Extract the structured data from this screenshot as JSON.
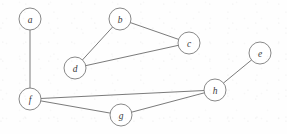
{
  "figure": {
    "width": 287,
    "height": 134,
    "background_color": "#fefefe",
    "node_fill_color": "#ffffff",
    "node_stroke_color": "#7a7a7a",
    "edge_stroke_color": "#6b6b6b",
    "label_color": "#3a3a3a",
    "node_radius": 11
  },
  "graph": {
    "type": "undirected-graph",
    "node_count": 8,
    "edge_count": 8,
    "nodes": [
      {
        "id": "a",
        "label": "a",
        "x": 30,
        "y": 19
      },
      {
        "id": "b",
        "label": "b",
        "x": 120,
        "y": 19
      },
      {
        "id": "c",
        "label": "c",
        "x": 189,
        "y": 43
      },
      {
        "id": "d",
        "label": "d",
        "x": 75,
        "y": 68
      },
      {
        "id": "e",
        "label": "e",
        "x": 260,
        "y": 53
      },
      {
        "id": "f",
        "label": "f",
        "x": 30,
        "y": 99
      },
      {
        "id": "g",
        "label": "g",
        "x": 121,
        "y": 115
      },
      {
        "id": "h",
        "label": "h",
        "x": 215,
        "y": 90
      }
    ],
    "edges": [
      {
        "id": "a-f",
        "source": "a",
        "target": "f"
      },
      {
        "id": "b-c",
        "source": "b",
        "target": "c"
      },
      {
        "id": "b-d",
        "source": "b",
        "target": "d"
      },
      {
        "id": "c-d",
        "source": "c",
        "target": "d"
      },
      {
        "id": "e-h",
        "source": "e",
        "target": "h"
      },
      {
        "id": "f-g",
        "source": "f",
        "target": "g"
      },
      {
        "id": "f-h",
        "source": "f",
        "target": "h"
      },
      {
        "id": "g-h",
        "source": "g",
        "target": "h"
      }
    ],
    "components": [
      {
        "id": "component-1",
        "members": [
          "a",
          "f",
          "g",
          "h",
          "e"
        ]
      },
      {
        "id": "component-2",
        "members": [
          "b",
          "c",
          "d"
        ]
      }
    ]
  }
}
